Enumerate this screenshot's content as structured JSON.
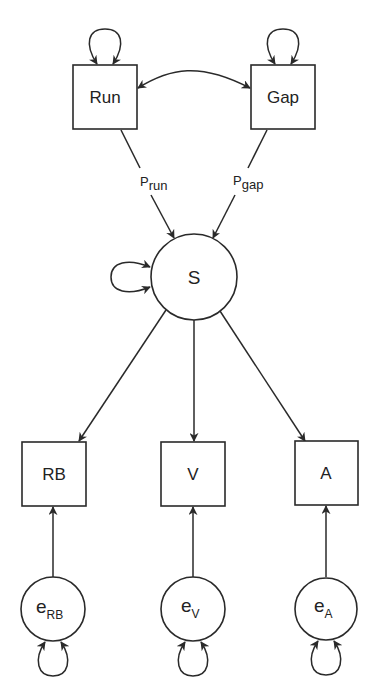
{
  "diagram": {
    "type": "path-diagram",
    "nodes": {
      "run": {
        "label": "Run",
        "shape": "box"
      },
      "gap": {
        "label": "Gap",
        "shape": "box"
      },
      "s": {
        "label": "S",
        "shape": "circle"
      },
      "rb": {
        "label": "RB",
        "shape": "box"
      },
      "v": {
        "label": "V",
        "shape": "box"
      },
      "a": {
        "label": "A",
        "shape": "box"
      },
      "e_rb": {
        "main": "e",
        "sub": "RB",
        "shape": "circle"
      },
      "e_v": {
        "main": "e",
        "sub": "V",
        "shape": "circle"
      },
      "e_a": {
        "main": "e",
        "sub": "A",
        "shape": "circle"
      }
    },
    "coefficients": {
      "p_run": {
        "main": "P",
        "sub": "run"
      },
      "p_gap": {
        "main": "P",
        "sub": "gap"
      }
    },
    "edges": [
      {
        "from": "Run",
        "to": "Gap",
        "type": "bidirectional-covariance"
      },
      {
        "from": "Run",
        "to": "S",
        "type": "directed",
        "label": "P_run"
      },
      {
        "from": "Gap",
        "to": "S",
        "type": "directed",
        "label": "P_gap"
      },
      {
        "from": "S",
        "to": "RB",
        "type": "directed"
      },
      {
        "from": "S",
        "to": "V",
        "type": "directed"
      },
      {
        "from": "S",
        "to": "A",
        "type": "directed"
      },
      {
        "from": "e_RB",
        "to": "RB",
        "type": "directed"
      },
      {
        "from": "e_V",
        "to": "V",
        "type": "directed"
      },
      {
        "from": "e_A",
        "to": "A",
        "type": "directed"
      }
    ],
    "self_loops": [
      "Run",
      "Gap",
      "S",
      "e_RB",
      "e_V",
      "e_A"
    ]
  }
}
